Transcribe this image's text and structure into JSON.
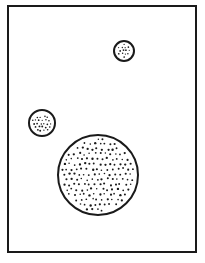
{
  "figure": {
    "kind": "line-art-diagram",
    "canvas": {
      "width": 205,
      "height": 263,
      "background": "#ffffff"
    },
    "frame": {
      "name": "rectangular-border",
      "x": 8,
      "y": 6,
      "width": 188,
      "height": 246,
      "stroke": "#1a1a1a",
      "stroke_width": 2,
      "fill": "none"
    },
    "circles": [
      {
        "id": "circle-small",
        "label": "small circle",
        "cx": 124,
        "cy": 51,
        "r": 10,
        "stroke": "#1a1a1a",
        "stroke_width": 2,
        "fill": "#ffffff",
        "stipple": {
          "spacing": 3.1,
          "dot_radius": 0.72,
          "color": "#1a1a1a"
        }
      },
      {
        "id": "circle-medium",
        "label": "medium circle",
        "cx": 42,
        "cy": 123,
        "r": 13,
        "stroke": "#1a1a1a",
        "stroke_width": 2,
        "fill": "#ffffff",
        "stipple": {
          "spacing": 3.4,
          "dot_radius": 0.78,
          "color": "#1a1a1a"
        }
      },
      {
        "id": "circle-large",
        "label": "large circle",
        "cx": 98,
        "cy": 175,
        "r": 40,
        "stroke": "#1a1a1a",
        "stroke_width": 2,
        "fill": "#ffffff",
        "stipple": {
          "spacing": 5.1,
          "dot_radius": 0.95,
          "color": "#1a1a1a"
        }
      }
    ]
  }
}
